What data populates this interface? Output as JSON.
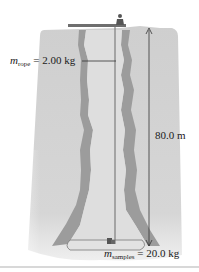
{
  "figure": {
    "type": "physics-diagram",
    "labels": {
      "rope_mass": {
        "symbol": "m",
        "subscript": "rope",
        "equals": "=",
        "value": "2.00 kg"
      },
      "shaft_depth": {
        "value": "80.0 m"
      },
      "samples_mass": {
        "symbol": "m",
        "subscript": "samples",
        "equals": "=",
        "value": "20.0 kg"
      }
    },
    "colors": {
      "rock_light": "#d4d4d4",
      "rock_mid": "#c6c6c6",
      "rock_dark": "#9a9a9a",
      "shaft_interior": "#e0e0e0",
      "rope": "#6a6a6a",
      "platform": "#7a7a7a",
      "text": "#1a1a1a"
    }
  }
}
